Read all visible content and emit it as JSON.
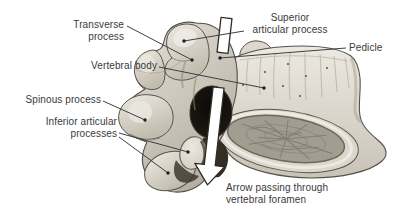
{
  "labels": {
    "transverse_process": {
      "line1": "Transverse",
      "line2": "process"
    },
    "superior_articular_process": {
      "line1": "Superior",
      "line2": "articular process"
    },
    "pedicle": {
      "text": "Pedicle"
    },
    "vertebral_body": {
      "text": "Vertebral body"
    },
    "spinous_process": {
      "text": "Spinous process"
    },
    "inferior_articular_processes": {
      "line1": "Inferior articular",
      "line2": "processes"
    },
    "arrow_caption": {
      "line1": "Arrow passing through",
      "line2": "vertebral foramen"
    }
  },
  "colors": {
    "background": "#ffffff",
    "text": "#3a3a3a",
    "leader_line": "#3f3f3f",
    "bone_light": "#ece9e2",
    "bone_mid": "#d6d1c7",
    "bone_shadow": "#a79f90",
    "bone_outline": "#55504a",
    "foramen_dark": "#0b0a07",
    "spongy_bone": "#a39d90",
    "arrow_fill": "#ffffff",
    "arrow_outline": "#2e2b26"
  }
}
